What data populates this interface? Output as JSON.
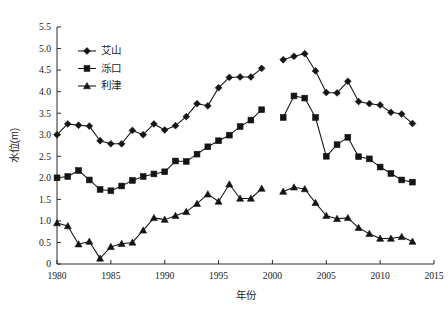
{
  "chart_data": {
    "type": "line",
    "title": "",
    "xlabel": "年份",
    "ylabel": "水位(m)",
    "xlim": [
      1980,
      2015
    ],
    "ylim": [
      0,
      5.5
    ],
    "xticks": [
      1980,
      1985,
      1990,
      1995,
      2000,
      2005,
      2010,
      2015
    ],
    "yticks": [
      "0",
      "0.5",
      "1.0",
      "1.5",
      "2.0",
      "2.5",
      "3.0",
      "3.5",
      "4.0",
      "4.5",
      "5.0",
      "5.5"
    ],
    "grid": false,
    "legend_position": "upper-left-inside",
    "note": "Series are split into two segments with a data gap between 1999 and 2001",
    "series": [
      {
        "name": "艾山",
        "marker": "diamond",
        "color": "#141414",
        "segments": [
          {
            "x": [
              1980,
              1981,
              1982,
              1983,
              1984,
              1985,
              1986,
              1987,
              1988,
              1989,
              1990,
              1991,
              1992,
              1993,
              1994,
              1995,
              1996,
              1997,
              1998,
              1999
            ],
            "y": [
              3.0,
              3.25,
              3.22,
              3.2,
              2.86,
              2.79,
              2.79,
              3.1,
              3.0,
              3.25,
              3.11,
              3.21,
              3.42,
              3.72,
              3.67,
              4.09,
              4.33,
              4.34,
              4.34,
              4.54
            ]
          },
          {
            "x": [
              2001,
              2002,
              2003,
              2004,
              2005,
              2006,
              2007,
              2008,
              2009,
              2010,
              2011,
              2012,
              2013
            ],
            "y": [
              4.74,
              4.82,
              4.88,
              4.48,
              3.98,
              3.97,
              4.24,
              3.77,
              3.72,
              3.69,
              3.52,
              3.48,
              3.26
            ]
          }
        ]
      },
      {
        "name": "泺口",
        "marker": "square",
        "color": "#141414",
        "segments": [
          {
            "x": [
              1980,
              1981,
              1982,
              1983,
              1984,
              1985,
              1986,
              1987,
              1988,
              1989,
              1990,
              1991,
              1992,
              1993,
              1994,
              1995,
              1996,
              1997,
              1998,
              1999
            ],
            "y": [
              2.0,
              2.03,
              2.17,
              1.95,
              1.73,
              1.7,
              1.81,
              1.94,
              2.03,
              2.09,
              2.14,
              2.39,
              2.38,
              2.55,
              2.72,
              2.86,
              2.99,
              3.19,
              3.34,
              3.58
            ]
          },
          {
            "x": [
              2001,
              2002,
              2003,
              2004,
              2005,
              2006,
              2007,
              2008,
              2009,
              2010,
              2011,
              2012,
              2013
            ],
            "y": [
              3.4,
              3.9,
              3.85,
              3.4,
              2.5,
              2.77,
              2.94,
              2.49,
              2.44,
              2.25,
              2.1,
              1.95,
              1.9
            ]
          }
        ]
      },
      {
        "name": "利津",
        "marker": "triangle",
        "color": "#141414",
        "segments": [
          {
            "x": [
              1980,
              1981,
              1982,
              1983,
              1984,
              1985,
              1986,
              1987,
              1988,
              1989,
              1990,
              1991,
              1992,
              1993,
              1994,
              1995,
              1996,
              1997,
              1998,
              1999
            ],
            "y": [
              0.95,
              0.88,
              0.46,
              0.52,
              0.13,
              0.4,
              0.47,
              0.5,
              0.78,
              1.07,
              1.03,
              1.12,
              1.21,
              1.4,
              1.62,
              1.45,
              1.85,
              1.52,
              1.52,
              1.75
            ]
          },
          {
            "x": [
              2001,
              2002,
              2003,
              2004,
              2005,
              2006,
              2007,
              2008,
              2009,
              2010,
              2011,
              2012,
              2013
            ],
            "y": [
              1.68,
              1.78,
              1.74,
              1.42,
              1.12,
              1.05,
              1.07,
              0.84,
              0.7,
              0.59,
              0.59,
              0.63,
              0.52
            ]
          }
        ]
      }
    ]
  }
}
